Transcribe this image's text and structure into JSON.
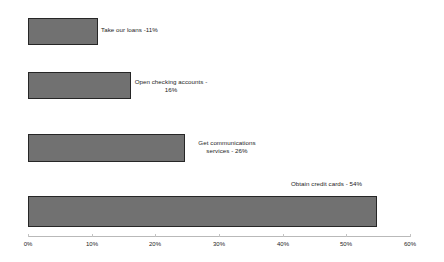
{
  "chart_data": {
    "type": "bar",
    "orientation": "horizontal",
    "title": "",
    "xlabel": "",
    "ylabel": "",
    "xlim": [
      0,
      60
    ],
    "grid": false,
    "legend": false,
    "value_suffix": "%",
    "bar_color": "#717171",
    "bar_border_color": "#262626",
    "axis_color": "#b9b9b9",
    "text_color": "#1c1c1c",
    "categories": [
      "Take our loans",
      "Open checking accounts",
      "Get communications services",
      "Obtain credit cards"
    ],
    "values": [
      11,
      16,
      26,
      54
    ],
    "data_labels": [
      "Take our loans -11%",
      "Open checking accounts - 16%",
      "Get communications services - 26%",
      "Obtain credit cards - 54%"
    ],
    "ticks": [
      {
        "value": 0,
        "label": "0%"
      },
      {
        "value": 10,
        "label": "10%"
      },
      {
        "value": 20,
        "label": "20%"
      },
      {
        "value": 30,
        "label": "30%"
      },
      {
        "value": 40,
        "label": "40%"
      },
      {
        "value": 50,
        "label": "50%"
      },
      {
        "value": 60,
        "label": "60%"
      }
    ]
  },
  "bars": [
    {
      "label": "Take our loans -11%",
      "value": 11,
      "top": 18,
      "height": 27,
      "width": 70,
      "label_left": 101,
      "label_top": 26,
      "label_style": "right-above"
    },
    {
      "label": "Open checking accounts - 16%",
      "value": 16,
      "top": 72,
      "height": 27,
      "width": 103,
      "label_left": 134,
      "label_top": 78,
      "label_style": "two-line"
    },
    {
      "label": "Get communications services - 26%",
      "value": 26,
      "top": 134,
      "height": 28,
      "width": 157,
      "label_left": 190,
      "label_top": 139,
      "label_style": "two-line"
    },
    {
      "label": "Obtain credit cards - 54%",
      "value": 54,
      "top": 196,
      "height": 31,
      "width": 349,
      "label_left": 291,
      "label_top": 180,
      "label_style": "right-above"
    }
  ],
  "axis": {
    "left": 28,
    "right": 410,
    "baseline_top": 236,
    "ticks": [
      {
        "label": "0%",
        "x": 28
      },
      {
        "label": "10%",
        "x": 92
      },
      {
        "label": "20%",
        "x": 155
      },
      {
        "label": "30%",
        "x": 219
      },
      {
        "label": "40%",
        "x": 283
      },
      {
        "label": "50%",
        "x": 346
      },
      {
        "label": "60%",
        "x": 410
      }
    ]
  }
}
